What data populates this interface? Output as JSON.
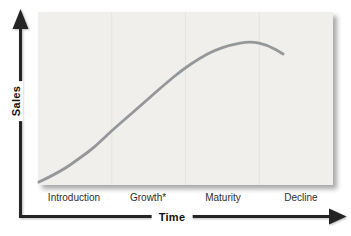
{
  "chart_data": {
    "type": "line",
    "title": "",
    "xlabel": "Time",
    "ylabel": "Sales",
    "categories": [
      "Introduction",
      "Growth*",
      "Maturity",
      "Decline"
    ],
    "series": [
      {
        "name": "sales-life-cycle-curve",
        "x_fraction": [
          0.003,
          0.075,
          0.142,
          0.193,
          0.244,
          0.312,
          0.369,
          0.431,
          0.488,
          0.549,
          0.6,
          0.651,
          0.719,
          0.78,
          0.831
        ],
        "y_fraction": [
          0.017,
          0.075,
          0.156,
          0.22,
          0.306,
          0.405,
          0.491,
          0.584,
          0.665,
          0.734,
          0.78,
          0.809,
          0.832,
          0.809,
          0.757
        ]
      }
    ],
    "ylim": [
      0,
      1
    ],
    "xlim": [
      0,
      1
    ],
    "legend": "none",
    "grid": {
      "vertical_dividers_x_fraction": [
        0.25,
        0.5,
        0.75
      ]
    },
    "colors": {
      "curve": "#95989a",
      "axis": "#242424",
      "panel": "#f0efec",
      "divider": "#e4e3e0",
      "label": "#2e2e2e"
    }
  }
}
